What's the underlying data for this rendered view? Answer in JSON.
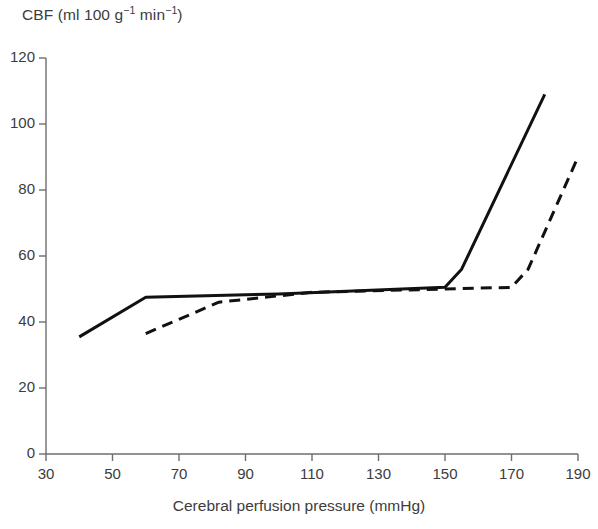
{
  "chart_data": {
    "type": "line",
    "title": "",
    "ylabel": "CBF (ml 100 g⁻¹ min⁻¹)",
    "ylabel_parts": {
      "prefix": "CBF (ml 100 g",
      "sup1": "−1",
      "middle": " min",
      "sup2": "−1",
      "suffix": ")"
    },
    "xlabel": "Cerebral perfusion pressure (mmHg)",
    "xlim": [
      30,
      190
    ],
    "ylim": [
      0,
      120
    ],
    "xticks": [
      30,
      50,
      70,
      90,
      110,
      130,
      150,
      170,
      190
    ],
    "yticks": [
      0,
      20,
      40,
      60,
      80,
      100,
      120
    ],
    "xtick_labels": [
      "30",
      "50",
      "70",
      "90",
      "110",
      "130",
      "150",
      "170",
      "190"
    ],
    "ytick_labels": [
      "0",
      "20",
      "40",
      "60",
      "80",
      "100",
      "120"
    ],
    "grid": false,
    "legend": "none",
    "axis_color": "#6e6e6e",
    "series": [
      {
        "name": "solid-curve",
        "style": "solid",
        "color": "#111111",
        "points": [
          [
            40,
            35.5
          ],
          [
            60,
            47.5
          ],
          [
            100,
            48.5
          ],
          [
            150,
            50.5
          ],
          [
            155,
            56
          ],
          [
            180,
            109
          ]
        ]
      },
      {
        "name": "dashed-curve",
        "style": "dashed",
        "color": "#111111",
        "points": [
          [
            60,
            36.5
          ],
          [
            82,
            46
          ],
          [
            110,
            49
          ],
          [
            150,
            50
          ],
          [
            170,
            50.5
          ],
          [
            175,
            56
          ],
          [
            190,
            90
          ]
        ]
      }
    ]
  }
}
